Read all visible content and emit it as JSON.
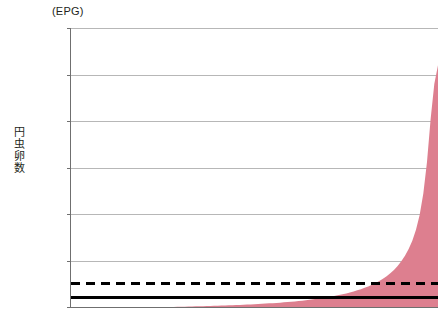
{
  "chart_data": {
    "type": "area",
    "title": "",
    "subtitle": "",
    "unit_caption": "(EPG)",
    "ylabel": "円虫卵数",
    "xlabel": "",
    "ylim": [
      0,
      6000
    ],
    "ytick_labels": [
      "6,000",
      "5,000",
      "4,000",
      "3,000",
      "2,000",
      "1,000",
      "0"
    ],
    "ytick_values": [
      6000,
      5000,
      4000,
      3000,
      2000,
      1000,
      0
    ],
    "xtick_labels": [],
    "grid": "horizontal",
    "legend": "none",
    "series_color": "#dd7f8f",
    "series": [
      {
        "name": "円虫卵数 (EPG) 昇順",
        "color": "#dd7f8f",
        "x": [
          0,
          1,
          2,
          3,
          4,
          5,
          6,
          7,
          8,
          9,
          10,
          11,
          12,
          13,
          14,
          15,
          16,
          17,
          18,
          19,
          20,
          21,
          22,
          23,
          24,
          25,
          26,
          27,
          28,
          29,
          30,
          31,
          32,
          33,
          34,
          35,
          36,
          37,
          38,
          39,
          40,
          41,
          42,
          43,
          44,
          45,
          46,
          47,
          48,
          49,
          50,
          51,
          52,
          53,
          54,
          55,
          56,
          57,
          58,
          59,
          60,
          61,
          62,
          63,
          64,
          65,
          66,
          67,
          68,
          69,
          70,
          71,
          72,
          73,
          74,
          75,
          76,
          77,
          78,
          79,
          80,
          81,
          82,
          83,
          84,
          85,
          86,
          87,
          88,
          89,
          90,
          91,
          92,
          93,
          94,
          95,
          96,
          97,
          98,
          99,
          100
        ],
        "values": [
          0,
          0,
          0,
          0,
          0,
          0,
          0,
          0,
          0,
          0,
          0,
          0,
          0,
          0,
          0,
          0,
          0,
          0,
          0,
          0,
          0,
          0,
          0,
          0,
          0,
          0,
          0,
          0,
          2,
          4,
          6,
          8,
          10,
          12,
          14,
          16,
          18,
          20,
          22,
          25,
          28,
          30,
          33,
          36,
          39,
          42,
          45,
          48,
          52,
          56,
          60,
          64,
          68,
          73,
          78,
          83,
          88,
          94,
          100,
          106,
          113,
          120,
          128,
          136,
          145,
          154,
          164,
          175,
          186,
          198,
          211,
          225,
          240,
          256,
          273,
          292,
          312,
          334,
          358,
          384,
          412,
          443,
          477,
          515,
          558,
          606,
          661,
          724,
          797,
          882,
          982,
          1100,
          1245,
          1425,
          1660,
          1980,
          2440,
          3120,
          4050,
          4800,
          5200
        ]
      }
    ],
    "reference_lines": [
      {
        "name": "solid-threshold",
        "value": 200,
        "style": "solid",
        "color": "#000000"
      },
      {
        "name": "dashed-threshold",
        "value": 500,
        "style": "dashed",
        "color": "#000000"
      }
    ]
  }
}
